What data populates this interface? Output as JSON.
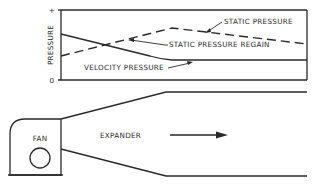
{
  "graph": {
    "y_axis_label": "PRESSURE",
    "y_axis_top_tick": "+",
    "y_axis_zero_tick": "0",
    "curves": [
      {
        "name": "static-pressure",
        "label": "STATIC PRESSURE",
        "style": "dashed"
      },
      {
        "name": "static-pressure-regain",
        "label": "STATIC PRESSURE REGAIN",
        "style": "arrow"
      },
      {
        "name": "velocity-pressure",
        "label": "VELOCITY PRESSURE",
        "style": "solid"
      }
    ]
  },
  "duct": {
    "fan_label": "FAN",
    "expander_label": "EXPANDER",
    "flow_direction": "right-arrow"
  },
  "colors": {
    "ink": "#2a2a2a",
    "background": "#ffffff"
  }
}
